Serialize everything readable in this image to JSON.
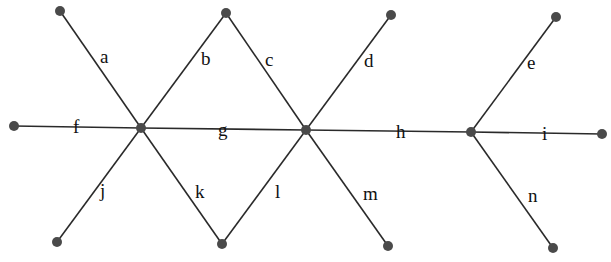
{
  "diagram": {
    "type": "graph",
    "colors": {
      "edge": "#2a2a2a",
      "node": "#4a4a4a",
      "label": "#111111"
    },
    "nodes": [
      {
        "id": "A",
        "x": 60,
        "y": 11
      },
      {
        "id": "B",
        "x": 226,
        "y": 13
      },
      {
        "id": "C",
        "x": 391,
        "y": 15
      },
      {
        "id": "D",
        "x": 556,
        "y": 17
      },
      {
        "id": "F",
        "x": 14,
        "y": 126
      },
      {
        "id": "H1",
        "x": 141,
        "y": 128
      },
      {
        "id": "H2",
        "x": 306,
        "y": 130
      },
      {
        "id": "H3",
        "x": 471,
        "y": 132
      },
      {
        "id": "I",
        "x": 602,
        "y": 134
      },
      {
        "id": "J",
        "x": 57,
        "y": 242
      },
      {
        "id": "K",
        "x": 222,
        "y": 244
      },
      {
        "id": "M",
        "x": 388,
        "y": 246
      },
      {
        "id": "N",
        "x": 553,
        "y": 248
      }
    ],
    "edges": [
      {
        "label": "a",
        "from": "A",
        "to": "H1",
        "lx": 100,
        "ly": 63
      },
      {
        "label": "b",
        "from": "B",
        "to": "H1",
        "lx": 201,
        "ly": 65
      },
      {
        "label": "c",
        "from": "B",
        "to": "H2",
        "lx": 265,
        "ly": 66
      },
      {
        "label": "d",
        "from": "C",
        "to": "H2",
        "lx": 364,
        "ly": 67
      },
      {
        "label": "e",
        "from": "D",
        "to": "H3",
        "lx": 527,
        "ly": 69
      },
      {
        "label": "f",
        "from": "F",
        "to": "H1",
        "lx": 73,
        "ly": 133
      },
      {
        "label": "g",
        "from": "H1",
        "to": "H2",
        "lx": 218,
        "ly": 136
      },
      {
        "label": "h",
        "from": "H2",
        "to": "H3",
        "lx": 396,
        "ly": 138
      },
      {
        "label": "i",
        "from": "H3",
        "to": "I",
        "lx": 542,
        "ly": 140
      },
      {
        "label": "j",
        "from": "H1",
        "to": "J",
        "lx": 100,
        "ly": 197
      },
      {
        "label": "k",
        "from": "H1",
        "to": "K",
        "lx": 195,
        "ly": 198
      },
      {
        "label": "l",
        "from": "H2",
        "to": "K",
        "lx": 275,
        "ly": 198
      },
      {
        "label": "m",
        "from": "H2",
        "to": "M",
        "lx": 363,
        "ly": 200
      },
      {
        "label": "n",
        "from": "H3",
        "to": "N",
        "lx": 528,
        "ly": 202
      }
    ]
  }
}
